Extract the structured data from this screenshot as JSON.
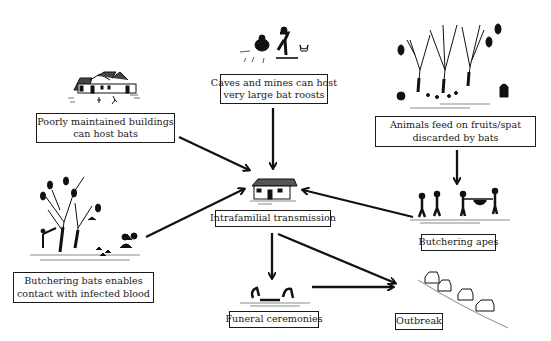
{
  "diagram": {
    "type": "flow diagram",
    "nodes": [
      {
        "id": "buildings",
        "lines": [
          "Poorly maintained buildings",
          "can host bats"
        ],
        "illustration": "houses-with-people"
      },
      {
        "id": "caves",
        "lines": [
          "Caves and mines can host",
          "very large bat roosts"
        ],
        "illustration": "miners-digging"
      },
      {
        "id": "animals",
        "lines": [
          "Animals feed on fruits/spat",
          "discarded by bats"
        ],
        "illustration": "fruit-trees-with-bats-and-apes"
      },
      {
        "id": "butcher_bats",
        "lines": [
          "Butchering bats enables",
          "contact with infected blood"
        ],
        "illustration": "hunter-with-bat-tree"
      },
      {
        "id": "intrafamilial",
        "lines": [
          "Intrafamilial transmission"
        ],
        "illustration": "house"
      },
      {
        "id": "funeral",
        "lines": [
          "Funeral ceremonies"
        ],
        "illustration": "mourners-with-body"
      },
      {
        "id": "butcher_apes",
        "lines": [
          "Butchering apes"
        ],
        "illustration": "hunters-carrying-ape"
      },
      {
        "id": "outbreak",
        "lines": [
          "Outbreak"
        ],
        "illustration": "row-of-houses"
      }
    ],
    "edges": [
      {
        "from": "buildings",
        "to": "intrafamilial"
      },
      {
        "from": "caves",
        "to": "intrafamilial"
      },
      {
        "from": "butcher_bats",
        "to": "intrafamilial"
      },
      {
        "from": "butcher_apes",
        "to": "intrafamilial"
      },
      {
        "from": "animals",
        "to": "butcher_apes"
      },
      {
        "from": "intrafamilial",
        "to": "funeral"
      },
      {
        "from": "intrafamilial",
        "to": "outbreak"
      },
      {
        "from": "funeral",
        "to": "outbreak"
      }
    ]
  }
}
